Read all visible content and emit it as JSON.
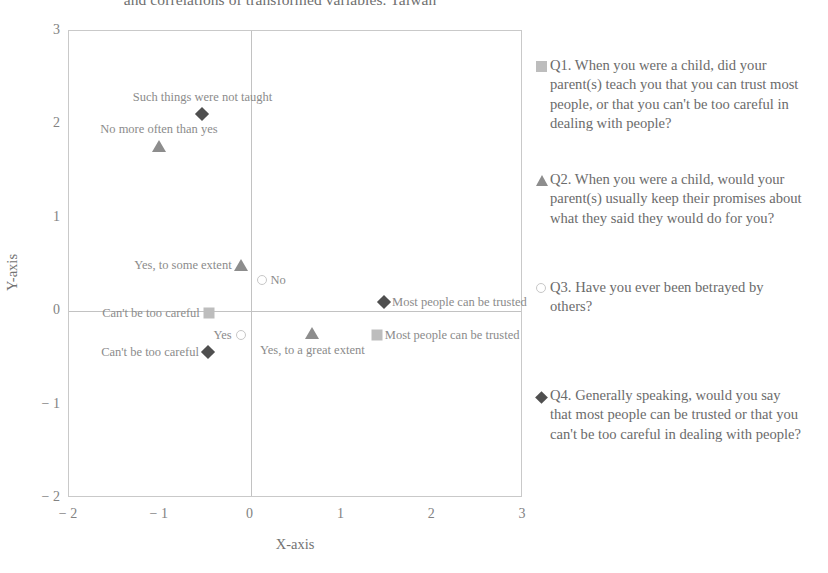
{
  "chart_data": {
    "type": "scatter",
    "title": "and correlations of transformed variables. Taiwan",
    "xlabel": "X-axis",
    "ylabel": "Y-axis",
    "xlim": [
      -2,
      3
    ],
    "ylim": [
      -2,
      3
    ],
    "xticks": [
      "− 2",
      "− 1",
      "0",
      "1",
      "2",
      "3"
    ],
    "xtick_values": [
      -2,
      -1,
      0,
      1,
      2,
      3
    ],
    "yticks": [
      "3",
      "2",
      "1",
      "0",
      "− 1",
      "− 2"
    ],
    "ytick_values": [
      3,
      2,
      1,
      0,
      -1,
      -2
    ],
    "grid": false,
    "zero_lines": true,
    "legend_position": "right",
    "series": [
      {
        "name": "Q1",
        "marker": "square",
        "color": "#bdbdbd",
        "legend_label": "Q1. When you were a child, did your parent(s) teach you that you can trust most people, or that you can't be too careful in dealing with people?",
        "points": [
          {
            "label": "Can't be too careful",
            "x": -0.46,
            "y": -0.02,
            "label_pos": "left"
          },
          {
            "label": "Most people can be trusted",
            "x": 1.39,
            "y": -0.25,
            "label_pos": "right"
          }
        ]
      },
      {
        "name": "Q2",
        "marker": "triangle",
        "color": "#8d8d8d",
        "legend_label": "Q2. When you were a child, would your parent(s) usually keep their promises about what they said they would do for you?",
        "points": [
          {
            "label": "No more often than yes",
            "x": -1.01,
            "y": 1.77,
            "label_pos": "above"
          },
          {
            "label": "Yes, to some extent",
            "x": -0.11,
            "y": 0.49,
            "label_pos": "left"
          },
          {
            "label": "Yes, to a great extent",
            "x": 0.68,
            "y": -0.23,
            "label_pos": "below"
          }
        ]
      },
      {
        "name": "Q3",
        "marker": "circle",
        "color": "#c7c7c7",
        "legend_label": "Q3. Have you ever been betrayed by others?",
        "points": [
          {
            "label": "No",
            "x": 0.13,
            "y": 0.33,
            "label_pos": "right"
          },
          {
            "label": "Yes",
            "x": -0.11,
            "y": -0.26,
            "label_pos": "left"
          }
        ]
      },
      {
        "name": "Q4",
        "marker": "diamond",
        "color": "#4f4f4f",
        "legend_label": "Q4. Generally speaking, would you say that most people can be trusted or that you can't be too careful in dealing with people?",
        "points": [
          {
            "label": "Such things were not taught",
            "x": -0.53,
            "y": 2.11,
            "label_pos": "above"
          },
          {
            "label": "Most people can be trusted",
            "x": 1.47,
            "y": 0.1,
            "label_pos": "right"
          },
          {
            "label": "Can't be too careful",
            "x": -0.47,
            "y": -0.44,
            "label_pos": "left"
          }
        ]
      }
    ]
  },
  "legend": {
    "entries": [
      {
        "marker": "square",
        "text": "Q1. When you were a child, did your parent(s) teach you that you can trust most people, or that you can't be too careful in dealing with people?",
        "top": 0,
        "width": 272
      },
      {
        "marker": "triangle",
        "text": "Q2. When you were a child, would your parent(s) usually keep their promises about what they said they would do for you?",
        "top": 114,
        "width": 268
      },
      {
        "marker": "circle",
        "text": "Q3. Have you ever been betrayed by others?",
        "top": 222,
        "width": 265
      },
      {
        "marker": "diamond",
        "text": "Q4. Generally speaking, would you say that most people can be trusted or that you can't be too careful in dealing with people?",
        "top": 330,
        "width": 266
      }
    ]
  }
}
